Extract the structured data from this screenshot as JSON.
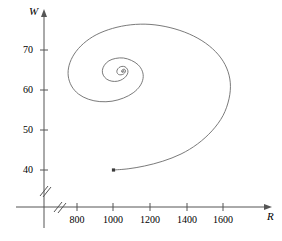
{
  "figure": {
    "title": "",
    "background_color": "#ffffff",
    "curve_color": "#6b6b6b",
    "axis_color": "#555555",
    "width": 282,
    "height": 241
  },
  "axes": {
    "x": {
      "label": "R",
      "label_name": "x-axis-label-R",
      "ticks": [
        {
          "value": 800,
          "text": "800"
        },
        {
          "value": 1000,
          "text": "1000"
        },
        {
          "value": 1200,
          "text": "1200"
        },
        {
          "value": 1400,
          "text": "1400"
        },
        {
          "value": 1600,
          "text": "1600"
        }
      ],
      "has_arrow": true,
      "has_break_mark": true,
      "break_mark": "//"
    },
    "y": {
      "label": "W",
      "label_name": "y-axis-label-W",
      "ticks": [
        {
          "value": 70,
          "text": "70"
        },
        {
          "value": 60,
          "text": "60"
        },
        {
          "value": 50,
          "text": "50"
        },
        {
          "value": 40,
          "text": "40"
        }
      ],
      "has_arrow": true,
      "has_break_mark": true,
      "break_mark": "//"
    }
  },
  "chart_data": {
    "type": "line",
    "title": "",
    "xlabel": "R",
    "ylabel": "W",
    "xlim": [
      620,
      1880
    ],
    "ylim": [
      32,
      79
    ],
    "grid": false,
    "legend": null,
    "series": [
      {
        "name": "phase-trajectory",
        "style": "inward-spiral",
        "marker_at_start": true,
        "start_point": {
          "R": 1000,
          "W": 40
        },
        "equilibrium_point": {
          "R": 1090,
          "W": 64.5
        },
        "points": [
          {
            "R": 1000,
            "W": 40.0
          },
          {
            "R": 1080,
            "W": 40.3
          },
          {
            "R": 1170,
            "W": 41.0
          },
          {
            "R": 1270,
            "W": 42.2
          },
          {
            "R": 1370,
            "W": 44.0
          },
          {
            "R": 1460,
            "W": 46.5
          },
          {
            "R": 1540,
            "W": 49.8
          },
          {
            "R": 1600,
            "W": 53.6
          },
          {
            "R": 1633,
            "W": 57.8
          },
          {
            "R": 1640,
            "W": 61.8
          },
          {
            "R": 1620,
            "W": 65.5
          },
          {
            "R": 1575,
            "W": 68.8
          },
          {
            "R": 1505,
            "W": 71.7
          },
          {
            "R": 1415,
            "W": 74.0
          },
          {
            "R": 1310,
            "W": 75.6
          },
          {
            "R": 1200,
            "W": 76.4
          },
          {
            "R": 1095,
            "W": 76.3
          },
          {
            "R": 995,
            "W": 75.4
          },
          {
            "R": 905,
            "W": 73.8
          },
          {
            "R": 835,
            "W": 71.6
          },
          {
            "R": 785,
            "W": 69.0
          },
          {
            "R": 757,
            "W": 66.2
          },
          {
            "R": 752,
            "W": 63.5
          },
          {
            "R": 770,
            "W": 61.0
          },
          {
            "R": 808,
            "W": 59.0
          },
          {
            "R": 862,
            "W": 57.7
          },
          {
            "R": 925,
            "W": 57.1
          },
          {
            "R": 992,
            "W": 57.2
          },
          {
            "R": 1055,
            "W": 58.0
          },
          {
            "R": 1108,
            "W": 59.3
          },
          {
            "R": 1145,
            "W": 61.0
          },
          {
            "R": 1162,
            "W": 62.9
          },
          {
            "R": 1158,
            "W": 64.7
          },
          {
            "R": 1135,
            "W": 66.3
          },
          {
            "R": 1098,
            "W": 67.4
          },
          {
            "R": 1055,
            "W": 68.0
          },
          {
            "R": 1012,
            "W": 67.9
          },
          {
            "R": 975,
            "W": 67.3
          },
          {
            "R": 950,
            "W": 66.2
          },
          {
            "R": 939,
            "W": 64.9
          },
          {
            "R": 944,
            "W": 63.7
          },
          {
            "R": 963,
            "W": 62.7
          },
          {
            "R": 991,
            "W": 62.2
          },
          {
            "R": 1022,
            "W": 62.2
          },
          {
            "R": 1050,
            "W": 62.7
          },
          {
            "R": 1070,
            "W": 63.5
          },
          {
            "R": 1079,
            "W": 64.4
          },
          {
            "R": 1076,
            "W": 65.2
          },
          {
            "R": 1063,
            "W": 65.8
          },
          {
            "R": 1046,
            "W": 65.9
          },
          {
            "R": 1030,
            "W": 65.6
          },
          {
            "R": 1020,
            "W": 65.0
          },
          {
            "R": 1019,
            "W": 64.4
          },
          {
            "R": 1027,
            "W": 63.9
          },
          {
            "R": 1041,
            "W": 63.8
          },
          {
            "R": 1055,
            "W": 64.0
          },
          {
            "R": 1064,
            "W": 64.5
          },
          {
            "R": 1065,
            "W": 65.0
          },
          {
            "R": 1058,
            "W": 65.2
          },
          {
            "R": 1050,
            "W": 65.1
          },
          {
            "R": 1044,
            "W": 64.8
          },
          {
            "R": 1045,
            "W": 64.5
          },
          {
            "R": 1051,
            "W": 64.4
          },
          {
            "R": 1057,
            "W": 64.6
          },
          {
            "R": 1058,
            "W": 64.8
          },
          {
            "R": 1054,
            "W": 64.9
          },
          {
            "R": 1050,
            "W": 64.8
          },
          {
            "R": 1049,
            "W": 64.6
          },
          {
            "R": 1052,
            "W": 64.6
          },
          {
            "R": 1054,
            "W": 64.7
          }
        ]
      }
    ]
  }
}
